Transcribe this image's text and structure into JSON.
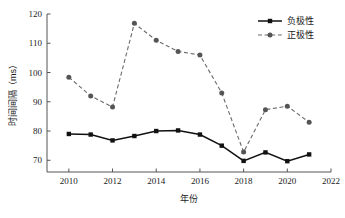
{
  "chart_data": {
    "type": "line",
    "title": "",
    "xlabel": "年份",
    "ylabel": "时间间隔（ms）",
    "x": [
      2010,
      2011,
      2012,
      2013,
      2014,
      2015,
      2016,
      2017,
      2018,
      2019,
      2020,
      2021
    ],
    "xlim": [
      2009,
      2022
    ],
    "ylim": [
      66,
      120
    ],
    "xticks": [
      2010,
      2012,
      2014,
      2016,
      2018,
      2020,
      2022
    ],
    "yticks": [
      70,
      80,
      90,
      100,
      110,
      120
    ],
    "xtick_labels": [
      "2010",
      "2012",
      "2014",
      "2016",
      "2018",
      "2020",
      "2022"
    ],
    "ytick_labels": [
      "70",
      "80",
      "90",
      "100",
      "110",
      "120"
    ],
    "grid": false,
    "legend_position": "top-right",
    "series": [
      {
        "name": "负极性",
        "color": "#111111",
        "linestyle": "solid",
        "marker": "square",
        "values": [
          79.0,
          78.8,
          76.8,
          78.3,
          80.0,
          80.2,
          78.8,
          75.0,
          69.8,
          72.7,
          69.7,
          72.0
        ]
      },
      {
        "name": "正极性",
        "color": "#555555",
        "linestyle": "dashed",
        "marker": "circle",
        "values": [
          98.4,
          92.0,
          88.2,
          116.8,
          111.0,
          107.2,
          106.0,
          93.0,
          72.8,
          87.3,
          88.5,
          83.0
        ]
      }
    ]
  },
  "legend": {
    "items": [
      {
        "label": "负极性"
      },
      {
        "label": "正极性"
      }
    ]
  }
}
